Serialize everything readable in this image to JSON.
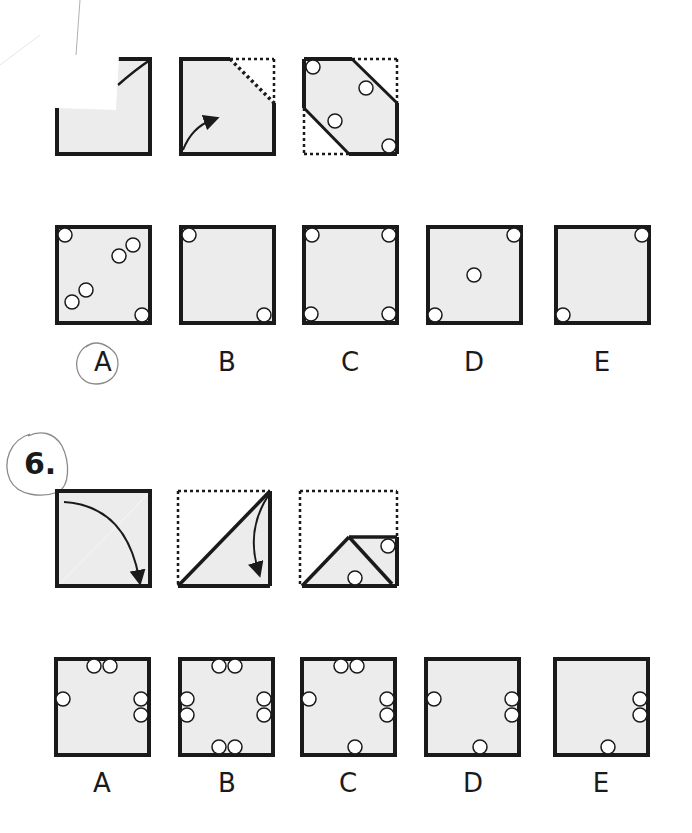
{
  "question5": {
    "fold_sequence_labels": [
      "step-1",
      "step-2",
      "step-3"
    ],
    "answers": [
      {
        "label": "A",
        "circled": true
      },
      {
        "label": "B",
        "circled": false
      },
      {
        "label": "C",
        "circled": false
      },
      {
        "label": "D",
        "circled": false
      },
      {
        "label": "E",
        "circled": false
      }
    ]
  },
  "question6": {
    "number": "6.",
    "number_circled": true,
    "fold_sequence_labels": [
      "step-1",
      "step-2",
      "step-3"
    ],
    "answers": [
      {
        "label": "A"
      },
      {
        "label": "B"
      },
      {
        "label": "C"
      },
      {
        "label": "D"
      },
      {
        "label": "E"
      }
    ]
  },
  "colors": {
    "paper_fill": "#ececec",
    "stroke": "#1a1a1a",
    "pencil": "#8a8a8a"
  }
}
